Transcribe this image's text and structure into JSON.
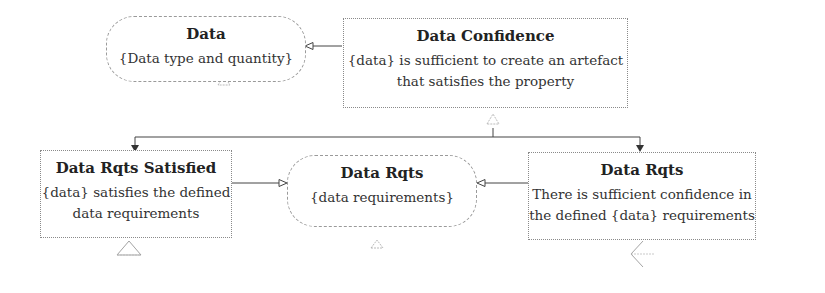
{
  "diagram": {
    "type": "goal-structure",
    "nodes": [
      {
        "id": "data",
        "shape": "rounded",
        "title": "Data",
        "body": [
          "{Data type and quantity}"
        ]
      },
      {
        "id": "data_confidence",
        "shape": "rect",
        "title": "Data Confidence",
        "body": [
          "{data} is sufficient to create an artefact",
          "that satisfies the property"
        ]
      },
      {
        "id": "data_rqts_satisfied",
        "shape": "rect",
        "title": "Data Rqts Satisfied",
        "body": [
          "{data} satisfies the defined",
          "data requirements"
        ]
      },
      {
        "id": "data_rqts_context",
        "shape": "rounded",
        "title": "Data Rqts",
        "body": [
          "{data requirements}"
        ]
      },
      {
        "id": "data_rqts_confidence",
        "shape": "rect",
        "title": "Data Rqts",
        "body": [
          "There is sufficient confidence in",
          "the defined {data} requirements"
        ]
      }
    ],
    "edges": [
      {
        "from": "data_confidence",
        "to": "data",
        "kind": "in-context-of"
      },
      {
        "from": "data_confidence",
        "to": "data_rqts_satisfied",
        "kind": "supported-by"
      },
      {
        "from": "data_confidence",
        "to": "data_rqts_confidence",
        "kind": "supported-by"
      },
      {
        "from": "data_rqts_satisfied",
        "to": "data_rqts_context",
        "kind": "in-context-of"
      },
      {
        "from": "data_rqts_confidence",
        "to": "data_rqts_context",
        "kind": "in-context-of"
      }
    ],
    "colors": {
      "line": "#333333",
      "border": "#8a8a8a",
      "text": "#2a2a2a"
    }
  }
}
